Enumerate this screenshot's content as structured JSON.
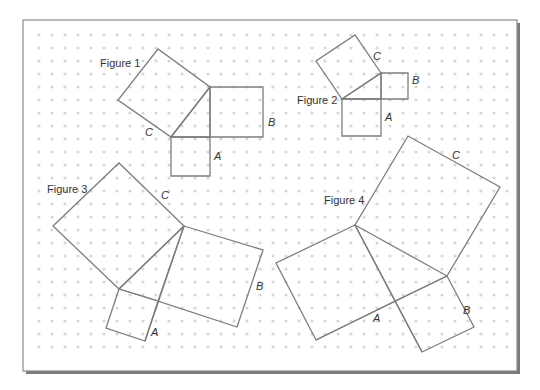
{
  "colors": {
    "background": "#ffffff",
    "frame_stroke": "#8a8a8a",
    "frame_shadow": "#7a7a7a",
    "grid_dot": "#d6d6d6",
    "shape_stroke": "#7d7d7d",
    "text": "#333333"
  },
  "frame": {
    "x": 23,
    "y": 20,
    "width": 494,
    "height": 351
  },
  "grid": {
    "x0": 39,
    "y0": 35,
    "dx": 13,
    "dy": 13,
    "cols": 37,
    "rows": 25,
    "r": 1.6
  },
  "figures": [
    {
      "title": "Figure 1",
      "title_pos": [
        100,
        67
      ],
      "polygons": [
        [
          [
            171,
            137
          ],
          [
            210,
            87
          ],
          [
            158,
            49
          ],
          [
            118,
            100
          ]
        ],
        [
          [
            210,
            87
          ],
          [
            263,
            87
          ],
          [
            263,
            137
          ],
          [
            210,
            137
          ]
        ],
        [
          [
            171,
            137
          ],
          [
            210,
            137
          ],
          [
            210,
            176
          ],
          [
            171,
            176
          ]
        ],
        [
          [
            171,
            137
          ],
          [
            210,
            87
          ],
          [
            210,
            137
          ]
        ]
      ],
      "labels": [
        {
          "text": "C",
          "pos": [
            145,
            136
          ]
        },
        {
          "text": "B",
          "pos": [
            268,
            126
          ]
        },
        {
          "text": "A",
          "pos": [
            214,
            160
          ]
        }
      ]
    },
    {
      "title": "Figure 2",
      "title_pos": [
        297,
        104
      ],
      "polygons": [
        [
          [
            342,
            99
          ],
          [
            381,
            73
          ],
          [
            355,
            35
          ],
          [
            316,
            61
          ]
        ],
        [
          [
            381,
            73
          ],
          [
            408,
            73
          ],
          [
            408,
            99
          ],
          [
            381,
            99
          ]
        ],
        [
          [
            342,
            99
          ],
          [
            381,
            99
          ],
          [
            381,
            136
          ],
          [
            342,
            136
          ]
        ],
        [
          [
            342,
            99
          ],
          [
            381,
            73
          ],
          [
            381,
            99
          ]
        ]
      ],
      "labels": [
        {
          "text": "C",
          "pos": [
            373,
            60
          ]
        },
        {
          "text": "B",
          "pos": [
            412,
            84
          ]
        },
        {
          "text": "A",
          "pos": [
            385,
            121
          ]
        }
      ]
    },
    {
      "title": "Figure 3",
      "title_pos": [
        47,
        193
      ],
      "polygons": [
        [
          [
            119,
            289
          ],
          [
            184,
            226
          ],
          [
            119,
            163
          ],
          [
            53,
            226
          ]
        ],
        [
          [
            184,
            226
          ],
          [
            263,
            250
          ],
          [
            237,
            327
          ],
          [
            158,
            301
          ]
        ],
        [
          [
            119,
            289
          ],
          [
            106,
            328
          ],
          [
            145,
            341
          ],
          [
            158,
            301
          ]
        ],
        [
          [
            119,
            289
          ],
          [
            184,
            226
          ]
        ],
        [
          [
            184,
            226
          ],
          [
            145,
            341
          ]
        ],
        [
          [
            119,
            289
          ],
          [
            158,
            301
          ]
        ]
      ],
      "labels": [
        {
          "text": "C",
          "pos": [
            161,
            199
          ]
        },
        {
          "text": "B",
          "pos": [
            256,
            290
          ]
        },
        {
          "text": "A",
          "pos": [
            151,
            336
          ]
        }
      ]
    },
    {
      "title": "Figure 4",
      "title_pos": [
        324,
        204
      ],
      "polygons": [
        [
          [
            355,
            225
          ],
          [
            447,
            276
          ],
          [
            500,
            187
          ],
          [
            408,
            136
          ]
        ],
        [
          [
            355,
            225
          ],
          [
            276,
            263
          ],
          [
            316,
            340
          ],
          [
            395,
            301
          ]
        ],
        [
          [
            395,
            301
          ],
          [
            447,
            276
          ],
          [
            474,
            327
          ],
          [
            422,
            352
          ]
        ],
        [
          [
            355,
            225
          ],
          [
            422,
            352
          ]
        ],
        [
          [
            316,
            340
          ],
          [
            447,
            276
          ]
        ]
      ],
      "labels": [
        {
          "text": "C",
          "pos": [
            452,
            159
          ]
        },
        {
          "text": "B",
          "pos": [
            463,
            314
          ]
        },
        {
          "text": "A",
          "pos": [
            373,
            322
          ]
        }
      ]
    }
  ]
}
